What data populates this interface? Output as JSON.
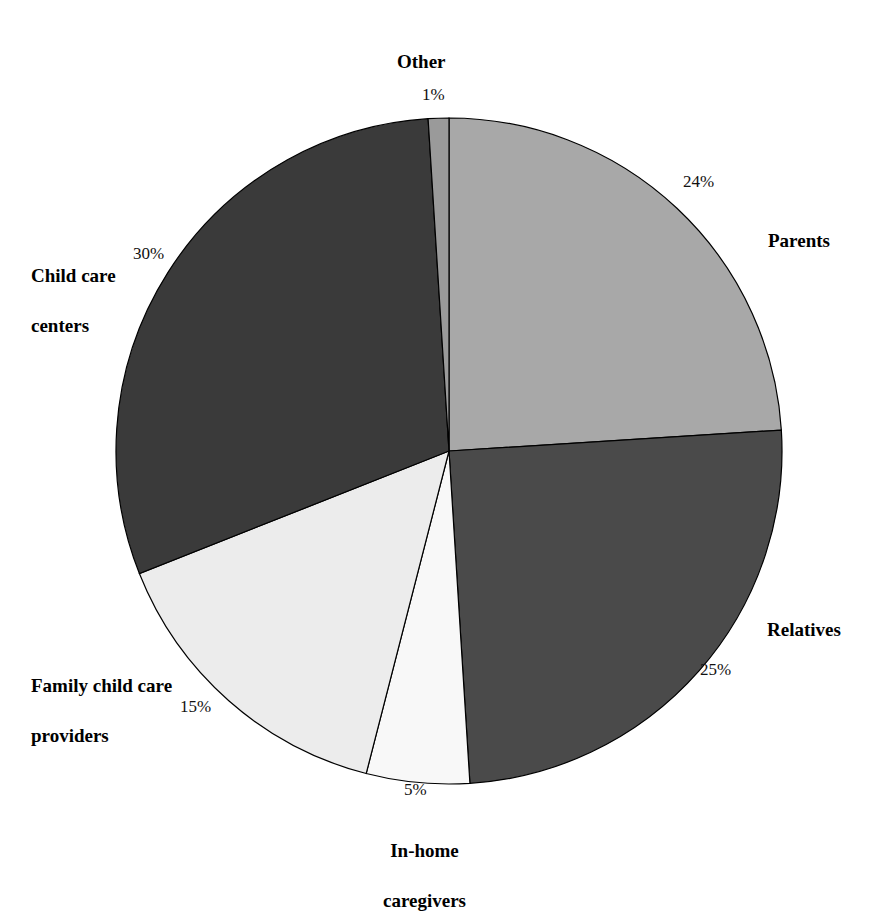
{
  "chart_data": {
    "type": "pie",
    "title": "",
    "subtitle": "",
    "xlabel": "",
    "ylabel": "",
    "legend_position": "none",
    "grid": false,
    "labels_outside": true,
    "start_angle_deg": 0,
    "direction": "clockwise",
    "center": {
      "x": 449,
      "y": 451,
      "radius": 333
    },
    "categories": [
      "Parents",
      "Relatives",
      "In-home caregivers",
      "Family child care providers",
      "Child care centers",
      "Other"
    ],
    "values": [
      24,
      25,
      5,
      15,
      30,
      1
    ],
    "value_labels": [
      "24%",
      "25%",
      "5%",
      "15%",
      "30%",
      "1%"
    ],
    "colors": [
      "#a8a8a8",
      "#4a4a4a",
      "#f8f8f8",
      "#ececec",
      "#3a3a3a",
      "#9a9a9a"
    ],
    "slices": [
      {
        "name": "parents",
        "category": "Parents",
        "value": 24,
        "value_label": "24%",
        "color": "#a8a8a8",
        "start_deg": 0,
        "end_deg": 86.4
      },
      {
        "name": "relatives",
        "category": "Relatives",
        "value": 25,
        "value_label": "25%",
        "color": "#4a4a4a",
        "start_deg": 86.4,
        "end_deg": 176.4
      },
      {
        "name": "in-home-caregivers",
        "category": "In-home caregivers",
        "category_line1": "In-home",
        "category_line2": "caregivers",
        "value": 5,
        "value_label": "5%",
        "color": "#f8f8f8",
        "start_deg": 176.4,
        "end_deg": 194.4
      },
      {
        "name": "family-child-care-providers",
        "category": "Family child care providers",
        "category_line1": "Family child care",
        "category_line2": "providers",
        "value": 15,
        "value_label": "15%",
        "color": "#ececec",
        "start_deg": 194.4,
        "end_deg": 248.4
      },
      {
        "name": "child-care-centers",
        "category": "Child care centers",
        "category_line1": "Child care",
        "category_line2": "centers",
        "value": 30,
        "value_label": "30%",
        "color": "#3a3a3a",
        "start_deg": 248.4,
        "end_deg": 356.4
      },
      {
        "name": "other",
        "category": "Other",
        "value": 1,
        "value_label": "1%",
        "color": "#9a9a9a",
        "start_deg": 356.4,
        "end_deg": 360
      }
    ],
    "stroke_color": "#000000",
    "background": "#ffffff",
    "total": 100
  },
  "labels": {
    "other": "Other",
    "parents": "Parents",
    "relatives": "Relatives",
    "inhome_line1": "In-home",
    "inhome_line2": "caregivers",
    "family_line1": "Family child care",
    "family_line2": "providers",
    "centers_line1": "Child care",
    "centers_line2": "centers"
  },
  "percents": {
    "other": "1%",
    "parents": "24%",
    "relatives": "25%",
    "inhome": "5%",
    "family": "15%",
    "centers": "30%"
  }
}
